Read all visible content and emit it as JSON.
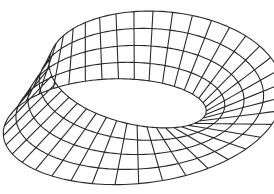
{
  "figure": {
    "stroke_color": "#2a2a2a",
    "background": "#ffffff",
    "grid": {
      "u_steps": 40,
      "v_steps": 4
    },
    "surface": {
      "radius": 1.0,
      "half_width": 0.42
    },
    "view": {
      "elev_deg": 38,
      "azim_deg": -62,
      "scale": 108,
      "cx": 136,
      "cy": 100
    }
  }
}
